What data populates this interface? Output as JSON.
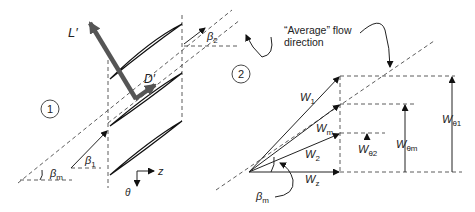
{
  "diagram": {
    "colors": {
      "force_arrow": "#555555",
      "line": "#222222",
      "background": "#ffffff"
    },
    "left_panel": {
      "station_1_label": "1",
      "force_labels": {
        "lift": "L′",
        "drag": "D′"
      },
      "angle_labels": {
        "beta_1": "β",
        "beta_1_sub": "1",
        "beta_2": "β",
        "beta_2_sub": "2",
        "beta_m": "β",
        "beta_m_sub": "m"
      },
      "axes": {
        "axial": "z",
        "tangential": "θ"
      }
    },
    "right_panel": {
      "station_2_label": "2",
      "annotation_line1": "“Average” flow",
      "annotation_line2": "direction",
      "vectors": [
        {
          "name": "W",
          "sub": "1"
        },
        {
          "name": "W",
          "sub": "m"
        },
        {
          "name": "W",
          "sub": "2"
        },
        {
          "name": "W",
          "sub": "z"
        }
      ],
      "components": [
        {
          "name": "W",
          "sub": "θ1"
        },
        {
          "name": "W",
          "sub": "θm"
        },
        {
          "name": "W",
          "sub": "θ2"
        }
      ],
      "angle_label": "β",
      "angle_sub": "m"
    }
  }
}
